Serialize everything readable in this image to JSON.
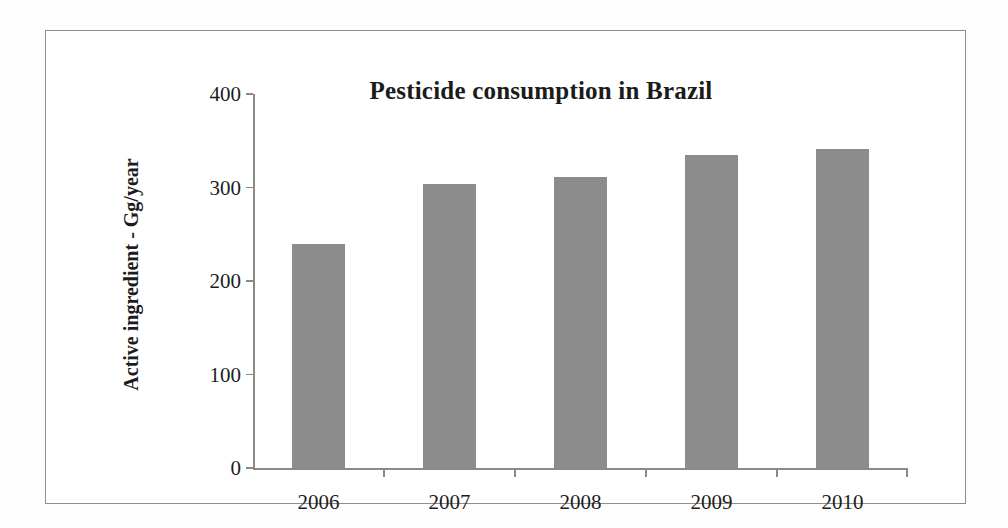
{
  "figure": {
    "border_color": "#8d8d8d",
    "background": "#ffffff"
  },
  "chart_data": {
    "type": "bar",
    "title": "Pesticide consumption in Brazil",
    "xlabel": "",
    "ylabel": "Active ingredient - Gg/year",
    "categories": [
      "2006",
      "2007",
      "2008",
      "2009",
      "2010"
    ],
    "values": [
      240,
      304,
      311,
      335,
      341
    ],
    "ylim": [
      0,
      400
    ],
    "yticks": [
      0,
      100,
      200,
      300,
      400
    ],
    "ytick_labels": [
      "0",
      "100",
      "200",
      "300",
      "400"
    ],
    "grid": false,
    "legend": false,
    "bar_color": "#8c8c8c",
    "axis_color": "#8a8a8a",
    "text_color": "#1d1d1d"
  }
}
